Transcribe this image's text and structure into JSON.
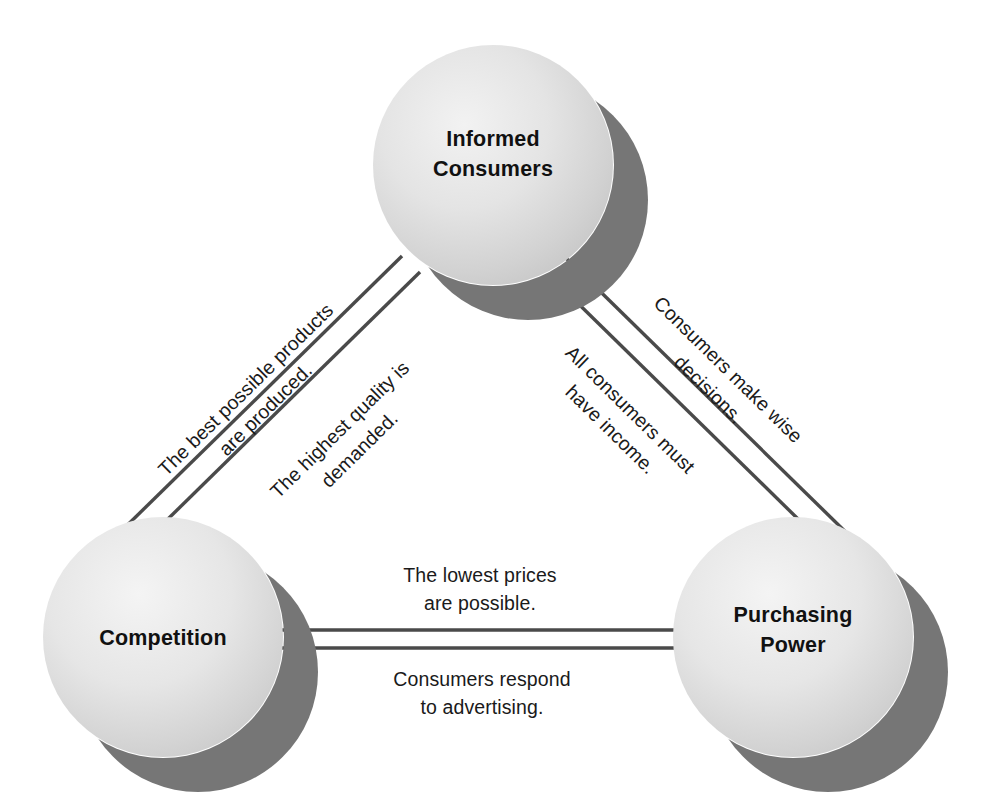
{
  "diagram": {
    "background_color": "#ffffff",
    "sphere_light_color": "#e9e9e9",
    "sphere_mid_color": "#c9c9c9",
    "shadow_color": "#767676",
    "line_color": "#4a4a4a",
    "text_color": "#111111",
    "nodes": [
      {
        "id": "informed-consumers",
        "line1": "Informed",
        "line2": "Consumers",
        "cx": 493,
        "cy": 165,
        "r": 120
      },
      {
        "id": "competition",
        "line1": "Competition",
        "line2": "",
        "cx": 163,
        "cy": 637,
        "r": 120
      },
      {
        "id": "purchasing-power",
        "line1": "Purchasing",
        "line2": "Power",
        "cx": 793,
        "cy": 637,
        "r": 120
      }
    ],
    "edges": [
      {
        "id": "left-edge-outer",
        "from": "informed-consumers",
        "to": "competition",
        "label_line1": "The best possible products",
        "label_line2": "are produced.",
        "position": "outer"
      },
      {
        "id": "left-edge-inner",
        "from": "informed-consumers",
        "to": "competition",
        "label_line1": "The highest quality is",
        "label_line2": "demanded.",
        "position": "inner"
      },
      {
        "id": "right-edge-outer",
        "from": "informed-consumers",
        "to": "purchasing-power",
        "label_line1": "Consumers make wise",
        "label_line2": "decisions.",
        "position": "outer"
      },
      {
        "id": "right-edge-inner",
        "from": "informed-consumers",
        "to": "purchasing-power",
        "label_line1": "All consumers must",
        "label_line2": "have income.",
        "position": "inner"
      },
      {
        "id": "bottom-edge-upper",
        "from": "competition",
        "to": "purchasing-power",
        "label_line1": "The lowest prices",
        "label_line2": "are possible.",
        "position": "above"
      },
      {
        "id": "bottom-edge-lower",
        "from": "competition",
        "to": "purchasing-power",
        "label_line1": "Consumers respond",
        "label_line2": "to advertising.",
        "position": "below"
      }
    ]
  }
}
